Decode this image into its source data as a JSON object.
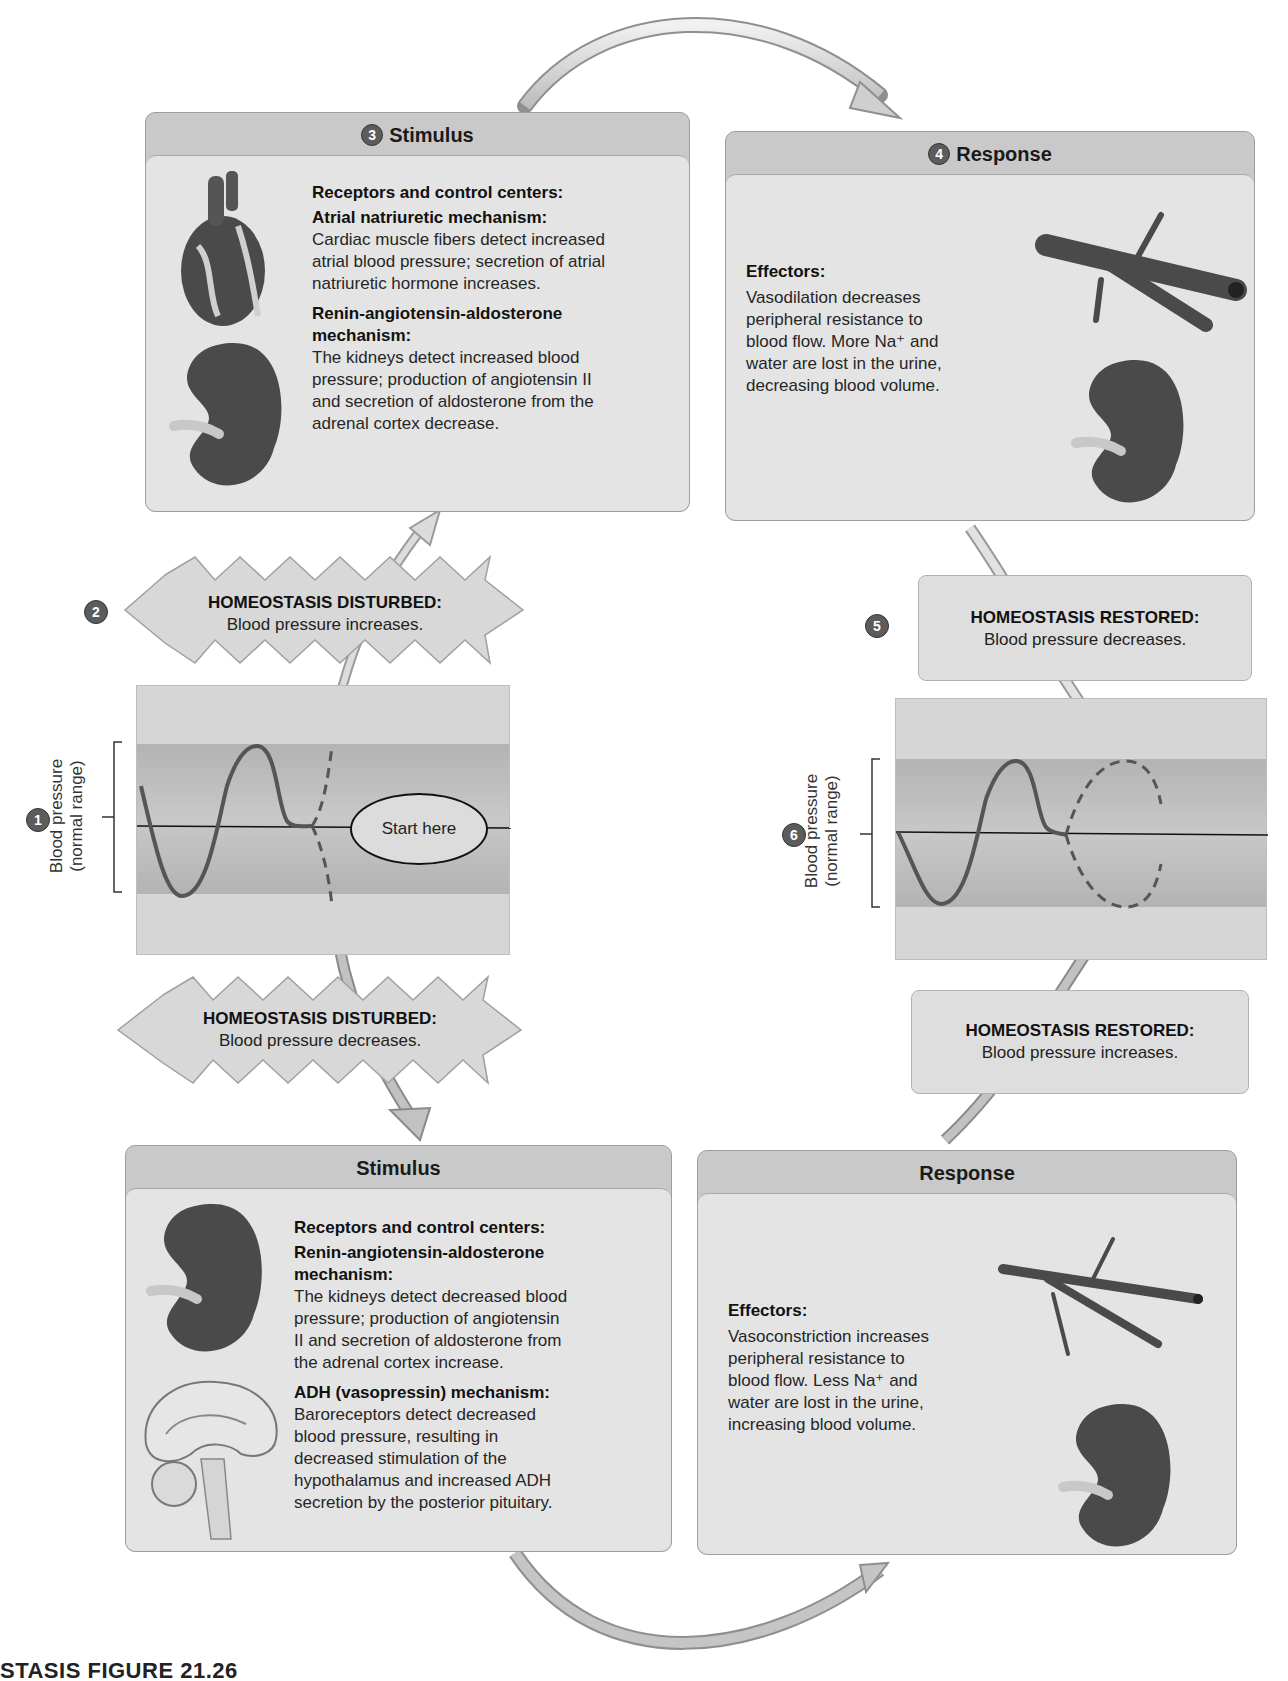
{
  "caption": {
    "figure_label": "STASIS FIGURE 21.26",
    "trailing_text": "Summary of homeostatic regulation of blood pressure (partially cut off)"
  },
  "top_stimulus": {
    "step": "3",
    "title": "Stimulus",
    "receptors_heading": "Receptors and control centers:",
    "mech1_heading": "Atrial natriuretic mechanism:",
    "mech1_lines": [
      "Cardiac muscle fibers detect increased",
      "atrial blood pressure; secretion of atrial",
      "natriuretic hormone increases."
    ],
    "mech2_heading_lines": [
      "Renin-angiotensin-aldosterone",
      "mechanism:"
    ],
    "mech2_lines": [
      "The kidneys detect increased blood",
      "pressure; production of angiotensin II",
      "and secretion of aldosterone from the",
      "adrenal cortex decrease."
    ],
    "icons": [
      "heart-illustration",
      "kidney-illustration"
    ]
  },
  "top_response": {
    "step": "4",
    "title": "Response",
    "effectors_heading": "Effectors:",
    "lines": [
      "Vasodilation decreases",
      "peripheral resistance to",
      "blood flow. More Na⁺ and",
      "water are lost in the urine,",
      "decreasing blood volume."
    ],
    "icons": [
      "dilated-blood-vessel-illustration",
      "kidney-illustration"
    ]
  },
  "disturbed_increase": {
    "step": "2",
    "heading": "HOMEOSTASIS DISTURBED:",
    "text": "Blood pressure increases."
  },
  "restored_decrease": {
    "step": "5",
    "heading": "HOMEOSTASIS RESTORED:",
    "text": "Blood pressure decreases."
  },
  "left_graph": {
    "step": "1",
    "axis_label_line1": "Blood pressure",
    "axis_label_line2": "(normal range)",
    "start_label": "Start here"
  },
  "right_graph": {
    "step": "6",
    "axis_label_line1": "Blood pressure",
    "axis_label_line2": "(normal range)"
  },
  "disturbed_decrease": {
    "heading": "HOMEOSTASIS DISTURBED:",
    "text": "Blood pressure decreases."
  },
  "restored_increase": {
    "heading": "HOMEOSTASIS RESTORED:",
    "text": "Blood pressure increases."
  },
  "bottom_stimulus": {
    "title": "Stimulus",
    "receptors_heading": "Receptors and control centers:",
    "mech1_heading_lines": [
      "Renin-angiotensin-aldosterone",
      "mechanism:"
    ],
    "mech1_lines": [
      "The kidneys detect decreased blood",
      "pressure; production of angiotensin",
      "II and secretion of aldosterone from",
      "the adrenal cortex increase."
    ],
    "mech2_heading": "ADH (vasopressin) mechanism:",
    "mech2_lines": [
      "Baroreceptors detect decreased",
      "blood pressure, resulting in",
      "decreased stimulation of the",
      "hypothalamus and increased ADH",
      "secretion by the posterior pituitary."
    ],
    "icons": [
      "kidney-illustration",
      "brain-illustration"
    ]
  },
  "bottom_response": {
    "title": "Response",
    "effectors_heading": "Effectors:",
    "lines": [
      "Vasoconstriction increases",
      "peripheral resistance to",
      "blood flow. Less Na⁺ and",
      "water are lost in the urine,",
      "increasing blood volume."
    ],
    "icons": [
      "constricted-blood-vessel-illustration",
      "kidney-illustration"
    ]
  },
  "colors": {
    "panel_header": "#c9c9c9",
    "panel_body": "#e4e4e4",
    "graph_bg": "#d6d6d6",
    "normal_band": "#b8b8b8",
    "curve": "#555555",
    "step_badge": "#5c5c5c"
  }
}
